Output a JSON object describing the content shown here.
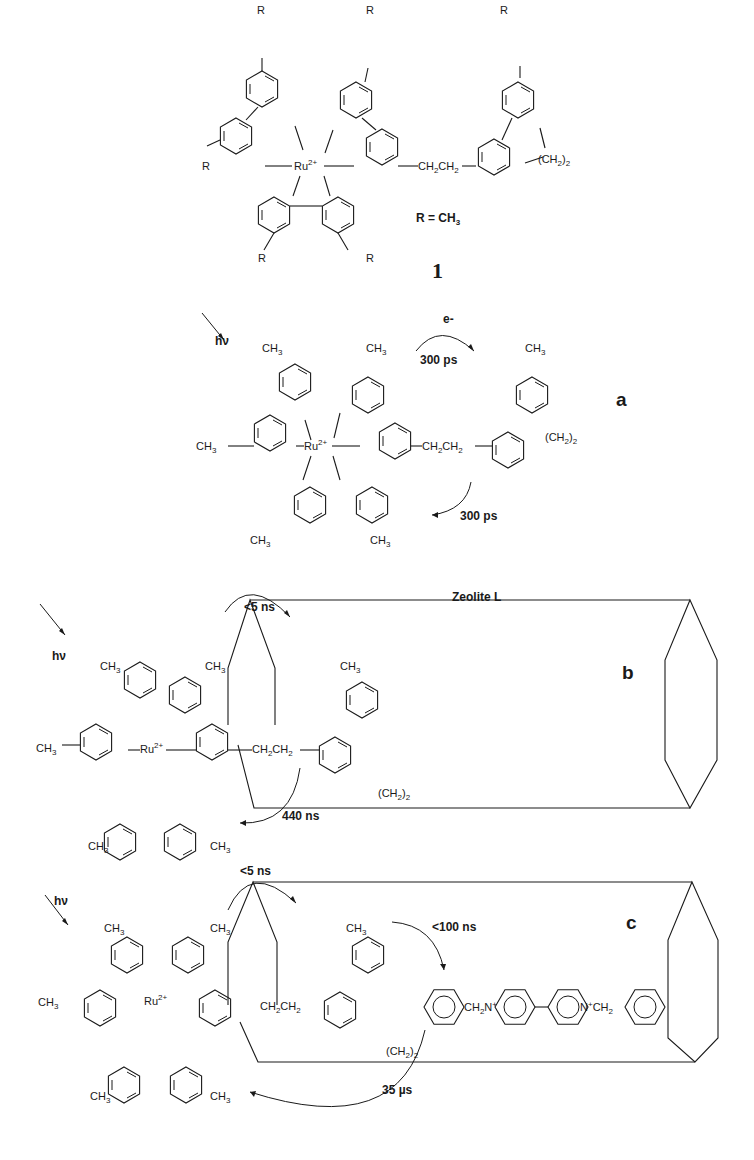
{
  "compound": {
    "number": "1",
    "r_definition": "R = CH3",
    "r_label": "R",
    "metal": "Ru",
    "metal_charge": "2+",
    "linker": "CH2CH2",
    "bridge": "(CH2)2",
    "n_plus": "N+",
    "n": "N"
  },
  "panels": [
    {
      "label": "a",
      "hv": "hν",
      "forward_label": "e-",
      "forward_time": "300 ps",
      "back_time": "300 ps"
    },
    {
      "label": "b",
      "hv": "hν",
      "host": "Zeolite L",
      "forward_time": "<5 ns",
      "back_time": "440 ns"
    },
    {
      "label": "c",
      "hv": "hν",
      "forward_time": "<5 ns",
      "transfer_time": "<100 ns",
      "back_time": "35 µs",
      "acceptor_left": "CH2N+",
      "acceptor_right": "N+CH2"
    }
  ],
  "substituent": "CH3"
}
